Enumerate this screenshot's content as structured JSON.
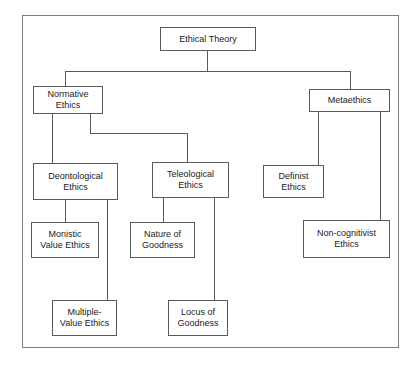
{
  "diagram": {
    "colors": {
      "background": "#ffffff",
      "frame_border": "#7c7c7c",
      "node_border": "#5a5a5a",
      "connector": "#5a5a5a",
      "text": "#1a1a1a"
    },
    "nodes": [
      {
        "id": "ethical-theory",
        "label": "Ethical Theory",
        "x": 160,
        "y": 27,
        "w": 96,
        "h": 24
      },
      {
        "id": "normative-ethics",
        "label": "Normative\nEthics",
        "x": 33,
        "y": 86,
        "w": 70,
        "h": 28
      },
      {
        "id": "metaethics",
        "label": "Metaethics",
        "x": 309,
        "y": 89,
        "w": 81,
        "h": 23
      },
      {
        "id": "deontological-ethics",
        "label": "Deontological\nEthics",
        "x": 33,
        "y": 163,
        "w": 85,
        "h": 37
      },
      {
        "id": "teleological-ethics",
        "label": "Teleological\nEthics",
        "x": 152,
        "y": 162,
        "w": 77,
        "h": 36
      },
      {
        "id": "definist-ethics",
        "label": "Definist\nEthics",
        "x": 263,
        "y": 165,
        "w": 61,
        "h": 33
      },
      {
        "id": "monistic-value-ethics",
        "label": "Monistic\nValue Ethics",
        "x": 31,
        "y": 222,
        "w": 68,
        "h": 36
      },
      {
        "id": "nature-of-goodness",
        "label": "Nature of\nGoodness",
        "x": 130,
        "y": 222,
        "w": 65,
        "h": 36
      },
      {
        "id": "non-cognitivist-ethics",
        "label": "Non-cognitivist\nEthics",
        "x": 303,
        "y": 220,
        "w": 87,
        "h": 38
      },
      {
        "id": "multiple-value-ethics",
        "label": "Multiple-\nValue Ethics",
        "x": 52,
        "y": 300,
        "w": 65,
        "h": 36
      },
      {
        "id": "locus-of-goodness",
        "label": "Locus of\nGoodness",
        "x": 168,
        "y": 300,
        "w": 60,
        "h": 36
      }
    ],
    "edges": [
      {
        "from": "ethical-theory",
        "to": "normative-ethics",
        "points": "207,51 207,71 65,71 65,86"
      },
      {
        "from": "ethical-theory",
        "to": "metaethics",
        "points": "207,51 207,71 350,71 350,89"
      },
      {
        "from": "normative-ethics",
        "to": "deontological-ethics",
        "points": "52,114 52,163"
      },
      {
        "from": "normative-ethics",
        "to": "teleological-ethics",
        "points": "90,114 90,133 187,133 187,162"
      },
      {
        "from": "deontological-ethics",
        "to": "monistic-value-ethics",
        "points": "65,200 65,222"
      },
      {
        "from": "deontological-ethics",
        "to": "multiple-value-ethics",
        "points": "107,200 107,300"
      },
      {
        "from": "teleological-ethics",
        "to": "nature-of-goodness",
        "points": "163,198 163,222"
      },
      {
        "from": "teleological-ethics",
        "to": "locus-of-goodness",
        "points": "214,198 214,300"
      },
      {
        "from": "metaethics",
        "to": "definist-ethics",
        "points": "318,112 318,165"
      },
      {
        "from": "metaethics",
        "to": "non-cognitivist-ethics",
        "points": "380,112 380,220"
      }
    ]
  }
}
